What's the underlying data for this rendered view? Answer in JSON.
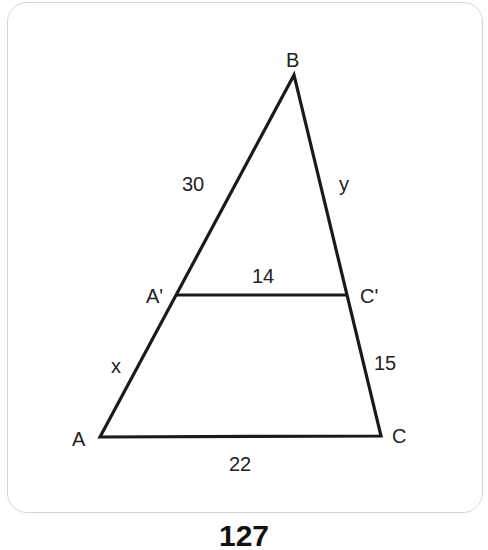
{
  "figure": {
    "vertices": {
      "A": {
        "label": "A",
        "x": 100,
        "y": 437
      },
      "B": {
        "label": "B",
        "x": 294,
        "y": 75
      },
      "C": {
        "label": "C",
        "x": 381,
        "y": 436
      },
      "A_prime": {
        "label": "A'",
        "x": 177,
        "y": 295
      },
      "C_prime": {
        "label": "C'",
        "x": 348,
        "y": 295
      }
    },
    "side_labels": {
      "BA_prime": "30",
      "BC_prime": "y",
      "A_prime_C_prime": "14",
      "A_prime_A": "x",
      "C_prime_C": "15",
      "AC": "22"
    },
    "stroke_color": "#1a1a1a"
  },
  "page": {
    "number": "127"
  }
}
